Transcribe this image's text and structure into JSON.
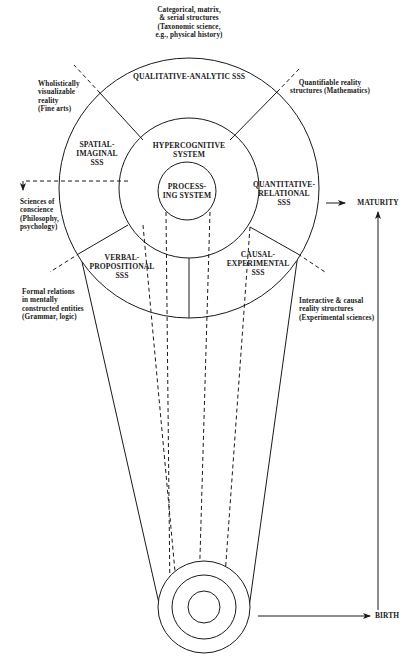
{
  "diagram": {
    "title": "",
    "core": {
      "processing_system": [
        "PROCESS-",
        "ING SYSTEM"
      ],
      "hypercognitive_system": [
        "HYPERCOGNITIVE",
        "SYSTEM"
      ]
    },
    "sss_segments": {
      "qualitative_analytic": [
        "QUALITATIVE-ANALYTIC SSS"
      ],
      "spatial_imaginal": [
        "SPATIAL-",
        "IMAGINAL",
        "SSS"
      ],
      "quantitative_relational": [
        "QUANTITATIVE-",
        "RELATIONAL",
        "SSS"
      ],
      "verbal_propositional": [
        "VERBAL-",
        "PROPOSITIONAL",
        "SSS"
      ],
      "causal_experimental": [
        "CAUSAL-",
        "EXPERIMENTAL",
        "SSS"
      ]
    },
    "domain_annotations": {
      "top": [
        "Categorical, matrix,",
        "& serial structures",
        "(Taxonomic science,",
        "e.g., physical history)"
      ],
      "upper_left": [
        "Wholistically",
        "visualizable",
        "reality",
        "(Fine arts)"
      ],
      "upper_right": [
        "Quantifiable reality",
        "structures (Mathematics)"
      ],
      "left": [
        "Sciences of",
        "conscience",
        "(Philosophy,",
        "psychology)"
      ],
      "lower_left": [
        "Formal relations",
        "in mentally",
        "constructed entities",
        "(Grammar, logic)"
      ],
      "lower_right": [
        "Interactive & causal",
        "reality structures",
        "(Experimental sciences)"
      ]
    },
    "development_axis": {
      "top_label": "MATURITY",
      "bottom_label": "BIRTH"
    },
    "colors": {
      "ink": "#1a1a1a",
      "background": "#ffffff"
    }
  }
}
